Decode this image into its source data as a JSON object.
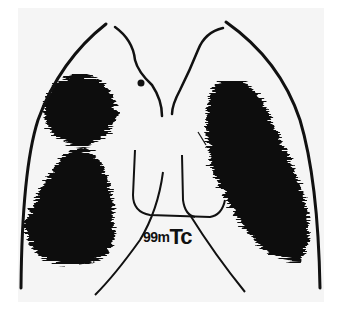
{
  "figure": {
    "isotope_label": {
      "mass": "99m",
      "element": "Tc"
    },
    "colors": {
      "background": "#f7f7f7",
      "uptake": "#111111",
      "outline": "#111111"
    }
  }
}
